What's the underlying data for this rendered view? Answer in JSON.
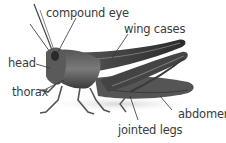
{
  "diagram": {
    "labels": {
      "compound_eye": "compound eye",
      "wing_cases": "wing cases",
      "head": "head",
      "thorax": "thorax",
      "abdomen": "abdomen",
      "jointed_legs": "jointed legs"
    }
  },
  "colors": {
    "background": "#ffffff",
    "text": "#3a3a3a",
    "leader_line": "#333333",
    "body_dark": "#2e2e2e",
    "body_mid": "#6b6b6b",
    "body_light": "#9a9a9a"
  }
}
